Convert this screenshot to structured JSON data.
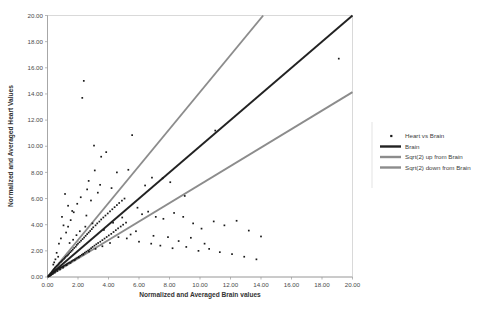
{
  "chart_data": {
    "type": "scatter",
    "title": "",
    "xlabel": "Normalized and Averaged Brain values",
    "ylabel": "Normalized and Averaged Heart Values",
    "xlim": [
      0,
      20
    ],
    "ylim": [
      0,
      20
    ],
    "grid": false,
    "legend_position": "right",
    "xticks": [
      "0.00",
      "2.00",
      "4.00",
      "6.00",
      "8.00",
      "10.00",
      "12.00",
      "14.00",
      "16.00",
      "18.00",
      "20.00"
    ],
    "yticks": [
      "0.00",
      "2.00",
      "4.00",
      "6.00",
      "8.00",
      "10.00",
      "12.00",
      "14.00",
      "16.00",
      "18.00",
      "20.00"
    ],
    "xtick_values": [
      0,
      2,
      4,
      6,
      8,
      10,
      12,
      14,
      16,
      18,
      20
    ],
    "ytick_values": [
      0,
      2,
      4,
      6,
      8,
      10,
      12,
      14,
      16,
      18,
      20
    ],
    "series": [
      {
        "name": "Heart vs Brain",
        "type": "scatter",
        "marker": "square-dot",
        "color": "#1a1a1a",
        "points": [
          [
            0.05,
            0.04
          ],
          [
            0.08,
            0.1
          ],
          [
            0.1,
            0.07
          ],
          [
            0.12,
            0.15
          ],
          [
            0.14,
            0.09
          ],
          [
            0.16,
            0.2
          ],
          [
            0.18,
            0.12
          ],
          [
            0.2,
            0.26
          ],
          [
            0.22,
            0.17
          ],
          [
            0.24,
            0.31
          ],
          [
            0.26,
            0.21
          ],
          [
            0.28,
            0.38
          ],
          [
            0.3,
            0.24
          ],
          [
            0.32,
            0.44
          ],
          [
            0.34,
            0.29
          ],
          [
            0.36,
            0.5
          ],
          [
            0.38,
            0.33
          ],
          [
            0.4,
            0.56
          ],
          [
            0.42,
            0.37
          ],
          [
            0.44,
            0.62
          ],
          [
            0.46,
            0.41
          ],
          [
            0.48,
            0.68
          ],
          [
            0.5,
            0.45
          ],
          [
            0.52,
            0.74
          ],
          [
            0.55,
            0.5
          ],
          [
            0.58,
            0.8
          ],
          [
            0.6,
            0.54
          ],
          [
            0.63,
            0.86
          ],
          [
            0.66,
            0.58
          ],
          [
            0.7,
            0.93
          ],
          [
            0.72,
            0.62
          ],
          [
            0.75,
            1.0
          ],
          [
            0.78,
            0.66
          ],
          [
            0.8,
            1.08
          ],
          [
            0.84,
            0.7
          ],
          [
            0.88,
            1.15
          ],
          [
            0.9,
            0.74
          ],
          [
            0.94,
            1.22
          ],
          [
            0.97,
            0.79
          ],
          [
            1.0,
            1.3
          ],
          [
            1.04,
            0.83
          ],
          [
            1.08,
            1.38
          ],
          [
            1.1,
            0.88
          ],
          [
            1.14,
            1.46
          ],
          [
            1.18,
            0.92
          ],
          [
            1.2,
            1.55
          ],
          [
            1.24,
            0.97
          ],
          [
            1.28,
            1.62
          ],
          [
            1.3,
            1.02
          ],
          [
            1.35,
            1.7
          ],
          [
            1.38,
            1.07
          ],
          [
            1.42,
            1.8
          ],
          [
            1.45,
            1.12
          ],
          [
            1.5,
            1.9
          ],
          [
            1.55,
            1.18
          ],
          [
            1.58,
            2.0
          ],
          [
            1.62,
            1.24
          ],
          [
            1.66,
            2.1
          ],
          [
            1.7,
            1.3
          ],
          [
            1.75,
            2.22
          ],
          [
            1.8,
            1.36
          ],
          [
            1.85,
            2.32
          ],
          [
            1.88,
            1.42
          ],
          [
            1.92,
            2.45
          ],
          [
            1.96,
            1.48
          ],
          [
            2.0,
            2.55
          ],
          [
            2.05,
            1.55
          ],
          [
            2.1,
            2.66
          ],
          [
            2.15,
            1.62
          ],
          [
            2.2,
            2.78
          ],
          [
            2.25,
            1.7
          ],
          [
            2.3,
            2.9
          ],
          [
            2.35,
            1.78
          ],
          [
            2.4,
            3.02
          ],
          [
            2.45,
            1.86
          ],
          [
            2.5,
            3.15
          ],
          [
            2.55,
            1.94
          ],
          [
            2.6,
            3.28
          ],
          [
            2.66,
            2.02
          ],
          [
            2.7,
            3.4
          ],
          [
            2.76,
            2.1
          ],
          [
            2.8,
            3.52
          ],
          [
            2.86,
            2.2
          ],
          [
            2.9,
            3.66
          ],
          [
            2.96,
            2.3
          ],
          [
            3.0,
            3.8
          ],
          [
            3.08,
            2.4
          ],
          [
            3.15,
            3.95
          ],
          [
            3.2,
            2.5
          ],
          [
            3.26,
            4.1
          ],
          [
            3.32,
            2.6
          ],
          [
            3.4,
            4.24
          ],
          [
            3.46,
            2.7
          ],
          [
            3.52,
            4.4
          ],
          [
            3.6,
            2.82
          ],
          [
            3.66,
            4.55
          ],
          [
            3.74,
            2.94
          ],
          [
            3.8,
            4.7
          ],
          [
            3.88,
            3.06
          ],
          [
            3.95,
            4.86
          ],
          [
            4.02,
            3.18
          ],
          [
            4.1,
            5.02
          ],
          [
            4.18,
            3.3
          ],
          [
            4.25,
            5.18
          ],
          [
            4.33,
            3.44
          ],
          [
            4.4,
            5.34
          ],
          [
            4.48,
            3.58
          ],
          [
            4.55,
            5.5
          ],
          [
            4.63,
            3.72
          ],
          [
            4.7,
            5.66
          ],
          [
            4.8,
            3.86
          ],
          [
            4.88,
            5.84
          ],
          [
            4.96,
            4.0
          ],
          [
            5.05,
            6.0
          ],
          [
            5.15,
            4.16
          ],
          [
            2.38,
            15.0
          ],
          [
            2.28,
            13.7
          ],
          [
            3.05,
            10.05
          ],
          [
            3.52,
            9.2
          ],
          [
            3.85,
            9.55
          ],
          [
            3.1,
            8.15
          ],
          [
            2.7,
            7.35
          ],
          [
            2.18,
            6.1
          ],
          [
            1.95,
            5.6
          ],
          [
            1.72,
            4.95
          ],
          [
            1.52,
            4.35
          ],
          [
            1.35,
            3.85
          ],
          [
            4.55,
            8.0
          ],
          [
            5.3,
            8.2
          ],
          [
            5.55,
            10.85
          ],
          [
            6.4,
            7.0
          ],
          [
            6.85,
            7.6
          ],
          [
            7.55,
            7.55
          ],
          [
            8.05,
            7.25
          ],
          [
            9.0,
            6.2
          ],
          [
            5.9,
            5.3
          ],
          [
            6.2,
            4.8
          ],
          [
            6.6,
            5.0
          ],
          [
            7.1,
            4.6
          ],
          [
            7.6,
            4.45
          ],
          [
            8.3,
            4.9
          ],
          [
            8.9,
            4.6
          ],
          [
            9.55,
            4.1
          ],
          [
            10.1,
            3.7
          ],
          [
            10.9,
            4.25
          ],
          [
            11.6,
            3.95
          ],
          [
            12.4,
            4.3
          ],
          [
            13.2,
            3.55
          ],
          [
            14.0,
            3.1
          ],
          [
            11.0,
            11.2
          ],
          [
            19.1,
            16.7
          ],
          [
            6.0,
            2.7
          ],
          [
            6.8,
            2.55
          ],
          [
            7.4,
            2.4
          ],
          [
            8.2,
            2.2
          ],
          [
            9.1,
            2.3
          ],
          [
            9.9,
            2.0
          ],
          [
            10.6,
            2.15
          ],
          [
            11.3,
            1.9
          ],
          [
            12.1,
            1.75
          ],
          [
            12.9,
            1.55
          ],
          [
            13.7,
            1.35
          ],
          [
            5.2,
            2.95
          ],
          [
            4.65,
            3.05
          ],
          [
            4.1,
            2.6
          ],
          [
            3.6,
            2.35
          ],
          [
            3.15,
            2.15
          ],
          [
            2.72,
            1.95
          ],
          [
            2.35,
            1.72
          ],
          [
            2.05,
            1.5
          ],
          [
            1.78,
            1.28
          ],
          [
            1.5,
            1.08
          ],
          [
            1.25,
            0.9
          ],
          [
            1.02,
            0.72
          ],
          [
            0.82,
            0.58
          ],
          [
            0.64,
            0.46
          ],
          [
            0.48,
            0.34
          ],
          [
            0.34,
            0.24
          ],
          [
            0.22,
            0.16
          ],
          [
            0.12,
            0.08
          ],
          [
            1.15,
            6.35
          ],
          [
            1.35,
            5.45
          ],
          [
            1.62,
            5.05
          ],
          [
            0.95,
            4.6
          ],
          [
            1.05,
            3.95
          ],
          [
            1.22,
            3.4
          ],
          [
            0.88,
            2.95
          ],
          [
            0.75,
            2.55
          ],
          [
            2.85,
            5.85
          ],
          [
            3.3,
            6.45
          ],
          [
            2.55,
            4.7
          ],
          [
            2.95,
            4.1
          ],
          [
            3.7,
            3.6
          ],
          [
            4.3,
            4.15
          ],
          [
            4.9,
            4.55
          ],
          [
            5.45,
            3.25
          ],
          [
            5.8,
            3.5
          ],
          [
            4.2,
            6.8
          ],
          [
            3.45,
            7.05
          ],
          [
            2.6,
            6.7
          ],
          [
            6.95,
            3.15
          ],
          [
            7.9,
            3.05
          ],
          [
            8.6,
            2.75
          ],
          [
            9.4,
            3.0
          ],
          [
            10.3,
            2.55
          ],
          [
            0.6,
            1.85
          ],
          [
            0.7,
            1.55
          ],
          [
            0.52,
            1.35
          ],
          [
            0.44,
            1.12
          ],
          [
            0.38,
            0.95
          ],
          [
            1.45,
            2.6
          ],
          [
            1.68,
            2.85
          ],
          [
            1.9,
            3.2
          ],
          [
            2.12,
            3.5
          ],
          [
            2.48,
            3.85
          ]
        ]
      },
      {
        "name": "Brain",
        "type": "line",
        "color": "#222222",
        "slope": 1.0,
        "from": [
          0,
          0
        ],
        "to": [
          20,
          20
        ]
      },
      {
        "name": "Sqrt(2) up from Brain",
        "type": "line",
        "color": "#8c8c8c",
        "slope": 1.4142,
        "from": [
          0,
          0
        ],
        "to": [
          14.142,
          20
        ]
      },
      {
        "name": "Sqrt(2) down from Brain",
        "type": "line",
        "color": "#8c8c8c",
        "slope": 0.7071,
        "from": [
          0,
          0
        ],
        "to": [
          20,
          14.142
        ]
      }
    ],
    "legend": [
      {
        "label": "Heart vs Brain",
        "marker": "point",
        "color": "#1a1a1a"
      },
      {
        "label": "Brain",
        "marker": "line",
        "color": "#222222"
      },
      {
        "label": "Sqrt(2) up from Brain",
        "marker": "line",
        "color": "#8c8c8c"
      },
      {
        "label": "Sqrt(2) down from Brain",
        "marker": "line",
        "color": "#8c8c8c"
      }
    ]
  }
}
